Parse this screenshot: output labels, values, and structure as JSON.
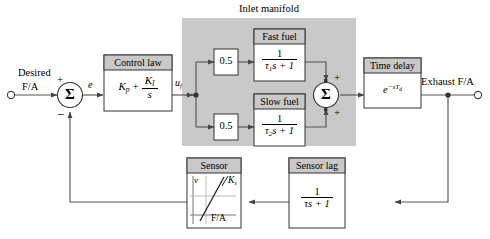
{
  "diagram": {
    "group_label": "Inlet manifold",
    "colors": {
      "group_fill": "#c9c9c9",
      "block_header_fill": "#c9c9c9",
      "block_body_fill": "#ffffff",
      "line": "#555555",
      "stroke": "#333333",
      "text": "#000000"
    },
    "signals": {
      "input_label_line1": "Desired",
      "input_label_line2": "F/A",
      "error_label": "e",
      "control_output_label_base": "u",
      "control_output_label_sub": "f",
      "output_label": "Exhaust F/A"
    },
    "sum_junctions": [
      {
        "name": "error-summing-junction",
        "symbol": "Σ",
        "signs": [
          "+",
          "−"
        ]
      },
      {
        "name": "fuel-summing-junction",
        "symbol": "Σ",
        "signs": [
          "+",
          "+"
        ]
      }
    ],
    "blocks": [
      {
        "name": "control-law",
        "title": "Control law",
        "body_kind": "pi-controller",
        "body_text": "K_p + K_I/s",
        "kp": "K",
        "kp_sub": "p",
        "plus": "+",
        "ki_num": "K",
        "ki_num_sub": "I",
        "ki_den": "s"
      },
      {
        "name": "fast-fuel-gain",
        "title": "",
        "body_text": "0.5"
      },
      {
        "name": "slow-fuel-gain",
        "title": "",
        "body_text": "0.5"
      },
      {
        "name": "fast-fuel",
        "title": "Fast fuel",
        "body_kind": "first-order-lag",
        "num": "1",
        "den_tau": "τ",
        "den_tau_sub": "1",
        "den_rest": "s + 1",
        "body_text": "1/(τ1s + 1)"
      },
      {
        "name": "slow-fuel",
        "title": "Slow fuel",
        "body_kind": "first-order-lag",
        "num": "1",
        "den_tau": "τ",
        "den_tau_sub": "2",
        "den_rest": "s + 1",
        "body_text": "1/(τ2s + 1)"
      },
      {
        "name": "time-delay",
        "title": "Time delay",
        "body_kind": "exponential-delay",
        "base": "e",
        "exponent": "−sT",
        "exponent_sub": "d",
        "body_text": "e^(−sT_d)"
      },
      {
        "name": "sensor",
        "title": "Sensor",
        "body_kind": "static-curve-plot",
        "y_axis_label": "v",
        "x_axis_label": "F/A",
        "slope_label": "K",
        "slope_label_sub": "s"
      },
      {
        "name": "sensor-lag",
        "title": "Sensor lag",
        "body_kind": "first-order-lag",
        "num": "1",
        "den_tau": "τ",
        "den_tau_sub": "",
        "den_rest": "s + 1",
        "body_text": "1/(τs + 1)"
      }
    ]
  }
}
